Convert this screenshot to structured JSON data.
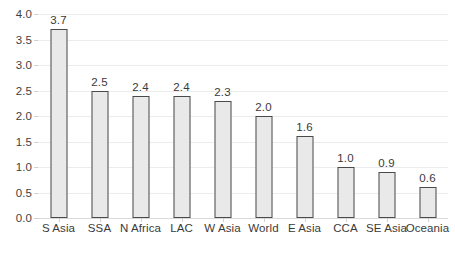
{
  "chart_data": {
    "type": "bar",
    "title": "",
    "subtitle": "",
    "xlabel": "",
    "ylabel": "",
    "ylim": [
      0.0,
      4.0
    ],
    "ytick_labels": [
      "0.0",
      "0.5",
      "1.0",
      "1.5",
      "2.0",
      "2.5",
      "3.0",
      "3.5",
      "4.0"
    ],
    "ytick_values": [
      0.0,
      0.5,
      1.0,
      1.5,
      2.0,
      2.5,
      3.0,
      3.5,
      4.0
    ],
    "grid": true,
    "grid_axis": "y",
    "legend": false,
    "legend_position": "none",
    "orientation": "vertical",
    "categories": [
      "S Asia",
      "SSA",
      "N Africa",
      "LAC",
      "W Asia",
      "World",
      "E Asia",
      "CCA",
      "SE Asia",
      "Oceania"
    ],
    "values": [
      3.7,
      2.5,
      2.4,
      2.4,
      2.3,
      2.0,
      1.6,
      1.0,
      0.9,
      0.6
    ],
    "data_labels": [
      "3.7",
      "2.5",
      "2.4",
      "2.4",
      "2.3",
      "2.0",
      "1.6",
      "1.0",
      "0.9",
      "0.6"
    ],
    "bars": [
      {
        "category": "S Asia",
        "value": 3.7,
        "label": "3.7"
      },
      {
        "category": "SSA",
        "value": 2.5,
        "label": "2.5"
      },
      {
        "category": "N Africa",
        "value": 2.4,
        "label": "2.4"
      },
      {
        "category": "LAC",
        "value": 2.4,
        "label": "2.4"
      },
      {
        "category": "W Asia",
        "value": 2.3,
        "label": "2.3"
      },
      {
        "category": "World",
        "value": 2.0,
        "label": "2.0"
      },
      {
        "category": "E Asia",
        "value": 1.6,
        "label": "1.6"
      },
      {
        "category": "CCA",
        "value": 1.0,
        "label": "1.0"
      },
      {
        "category": "SE Asia",
        "value": 0.9,
        "label": "0.9"
      },
      {
        "category": "Oceania",
        "value": 0.6,
        "label": "0.6"
      }
    ],
    "colors": {
      "bar_fill": "#e9e9e9",
      "bar_stroke": "#4a4a4a",
      "gridline": "#ececec",
      "baseline": "#d9d9d9",
      "text": "#3a3a3a",
      "background": "#ffffff"
    }
  }
}
